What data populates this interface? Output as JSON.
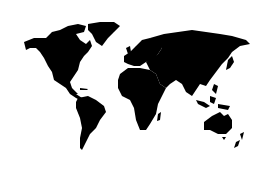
{
  "map": {
    "type": "world-silhouette",
    "land_color": "#000000",
    "background_color": "#ffffff",
    "continents": [
      "North America",
      "Greenland",
      "South America",
      "Europe",
      "Africa",
      "Asia",
      "Australia",
      "New Zealand"
    ]
  }
}
